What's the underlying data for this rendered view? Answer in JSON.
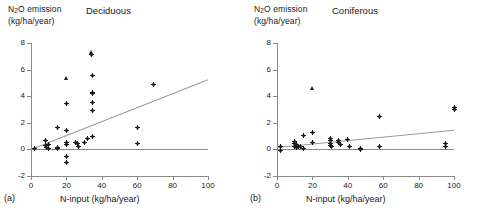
{
  "figure": {
    "panels": [
      {
        "id": "(a)",
        "title": "Deciduous",
        "ylabel_line1": "N",
        "ylabel_sub": "2",
        "ylabel_line1b": "O emission",
        "ylabel_line2": "(kg/ha/year)",
        "xcaption": "N-input (kg/ha/year)"
      },
      {
        "id": "(b)",
        "title": "Coniferous",
        "ylabel_line1": "N",
        "ylabel_sub": "2",
        "ylabel_line1b": "O emission",
        "ylabel_line2": "(kg/ha/year)",
        "xcaption": "N-input (kg/ha/year)"
      }
    ],
    "colors": {
      "axis": "#8a8a8a",
      "regression_line": "#9a9a9a",
      "marker": "#1a1a1a",
      "background": "#ffffff"
    }
  },
  "chart_data": [
    {
      "type": "scatter",
      "title": "Deciduous",
      "panel_label": "(a)",
      "xlabel": "N-input (kg/ha/year)",
      "ylabel": "N2O emission (kg/ha/year)",
      "xlim": [
        0,
        100
      ],
      "ylim": [
        -2,
        8
      ],
      "xticks": [
        0,
        20,
        40,
        60,
        80,
        100
      ],
      "yticks": [
        -2,
        0,
        2,
        4,
        6,
        8
      ],
      "grid": false,
      "legend": "none",
      "zero_line": {
        "y": 0,
        "color": "#8a8a8a"
      },
      "regression_line": {
        "x": [
          0,
          100
        ],
        "y": [
          0.05,
          5.3
        ],
        "color": "#9a9a9a"
      },
      "points": [
        {
          "x": 2,
          "y": 0.05,
          "marker": "cross"
        },
        {
          "x": 8,
          "y": 0.65,
          "marker": "cross"
        },
        {
          "x": 8,
          "y": 0.3,
          "marker": "cross"
        },
        {
          "x": 9,
          "y": 0.12,
          "marker": "cross"
        },
        {
          "x": 10,
          "y": 0.35,
          "marker": "cross"
        },
        {
          "x": 10,
          "y": 0.05,
          "marker": "cross"
        },
        {
          "x": 15,
          "y": 1.65,
          "marker": "cross"
        },
        {
          "x": 15,
          "y": 0.15,
          "marker": "cross"
        },
        {
          "x": 15,
          "y": 0.05,
          "marker": "cross"
        },
        {
          "x": 20,
          "y": 5.35,
          "marker": "triangle"
        },
        {
          "x": 20,
          "y": 3.45,
          "marker": "cross"
        },
        {
          "x": 20,
          "y": 1.45,
          "marker": "cross"
        },
        {
          "x": 20,
          "y": 0.55,
          "marker": "cross"
        },
        {
          "x": 20,
          "y": 0.4,
          "marker": "cross"
        },
        {
          "x": 20,
          "y": -0.5,
          "marker": "cross"
        },
        {
          "x": 20,
          "y": -0.95,
          "marker": "cross"
        },
        {
          "x": 25,
          "y": 0.5,
          "marker": "cross"
        },
        {
          "x": 26,
          "y": 0.45,
          "marker": "cross"
        },
        {
          "x": 27,
          "y": 0.2,
          "marker": "cross"
        },
        {
          "x": 30,
          "y": 0.55,
          "marker": "cross"
        },
        {
          "x": 32,
          "y": 0.8,
          "marker": "cross"
        },
        {
          "x": 34,
          "y": 7.25,
          "marker": "triangle"
        },
        {
          "x": 34,
          "y": 7.1,
          "marker": "cross"
        },
        {
          "x": 35,
          "y": 5.55,
          "marker": "cross"
        },
        {
          "x": 35,
          "y": 4.3,
          "marker": "cross"
        },
        {
          "x": 35,
          "y": 4.2,
          "marker": "cross"
        },
        {
          "x": 35,
          "y": 3.55,
          "marker": "cross"
        },
        {
          "x": 35,
          "y": 2.95,
          "marker": "cross"
        },
        {
          "x": 35,
          "y": 0.95,
          "marker": "cross"
        },
        {
          "x": 60,
          "y": 1.65,
          "marker": "cross"
        },
        {
          "x": 60,
          "y": 0.45,
          "marker": "cross"
        },
        {
          "x": 69,
          "y": 4.85,
          "marker": "cross"
        }
      ]
    },
    {
      "type": "scatter",
      "title": "Coniferous",
      "panel_label": "(b)",
      "xlabel": "N-input (kg/ha/year)",
      "ylabel": "N2O emission (kg/ha/year)",
      "xlim": [
        0,
        100
      ],
      "ylim": [
        -2,
        8
      ],
      "xticks": [
        0,
        20,
        40,
        60,
        80,
        100
      ],
      "yticks": [
        -2,
        0,
        2,
        4,
        6,
        8
      ],
      "grid": false,
      "legend": "none",
      "zero_line": {
        "y": 0,
        "color": "#8a8a8a"
      },
      "regression_line": {
        "x": [
          0,
          100
        ],
        "y": [
          0.15,
          1.45
        ],
        "color": "#9a9a9a"
      },
      "points": [
        {
          "x": 2,
          "y": 0.2,
          "marker": "cross"
        },
        {
          "x": 2,
          "y": -0.05,
          "marker": "cross"
        },
        {
          "x": 10,
          "y": 0.6,
          "marker": "cross"
        },
        {
          "x": 10,
          "y": 0.45,
          "marker": "cross"
        },
        {
          "x": 10,
          "y": 0.25,
          "marker": "cross"
        },
        {
          "x": 11,
          "y": 0.35,
          "marker": "cross"
        },
        {
          "x": 11,
          "y": 0.15,
          "marker": "cross"
        },
        {
          "x": 12,
          "y": 0.25,
          "marker": "cross"
        },
        {
          "x": 13,
          "y": 0.2,
          "marker": "cross"
        },
        {
          "x": 15,
          "y": 1.05,
          "marker": "cross"
        },
        {
          "x": 15,
          "y": 0.05,
          "marker": "cross"
        },
        {
          "x": 20,
          "y": 4.55,
          "marker": "triangle"
        },
        {
          "x": 20,
          "y": 1.3,
          "marker": "cross"
        },
        {
          "x": 20,
          "y": 0.5,
          "marker": "cross"
        },
        {
          "x": 30,
          "y": 0.85,
          "marker": "cross"
        },
        {
          "x": 30,
          "y": 0.7,
          "marker": "cross"
        },
        {
          "x": 30,
          "y": 0.45,
          "marker": "cross"
        },
        {
          "x": 30,
          "y": 0.3,
          "marker": "cross"
        },
        {
          "x": 31,
          "y": 0.25,
          "marker": "cross"
        },
        {
          "x": 35,
          "y": 0.7,
          "marker": "cross"
        },
        {
          "x": 35,
          "y": 0.55,
          "marker": "cross"
        },
        {
          "x": 36,
          "y": 0.35,
          "marker": "cross"
        },
        {
          "x": 40,
          "y": 0.75,
          "marker": "cross"
        },
        {
          "x": 41,
          "y": 0.2,
          "marker": "cross"
        },
        {
          "x": 47,
          "y": 0.1,
          "marker": "cross"
        },
        {
          "x": 47,
          "y": 0.0,
          "marker": "cross"
        },
        {
          "x": 58,
          "y": 2.45,
          "marker": "cross"
        },
        {
          "x": 58,
          "y": 0.25,
          "marker": "cross"
        },
        {
          "x": 95,
          "y": 0.45,
          "marker": "cross"
        },
        {
          "x": 95,
          "y": 0.2,
          "marker": "cross"
        },
        {
          "x": 100,
          "y": 3.15,
          "marker": "cross"
        },
        {
          "x": 100,
          "y": 3.0,
          "marker": "cross"
        }
      ]
    }
  ]
}
